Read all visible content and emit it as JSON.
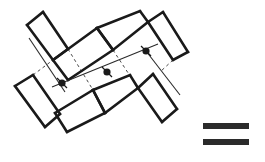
{
  "diagram": {
    "type": "line-drawing",
    "colors": {
      "stroke": "#1a1a1a",
      "bars": "#2b2b2b",
      "background": "#ffffff"
    },
    "rectangles": [
      {
        "id": "A",
        "points": "27,25 43,12 68,49 53,60"
      },
      {
        "id": "B",
        "points": "53,60 97,28 113,50 68,80"
      },
      {
        "id": "C",
        "points": "97,28 140,11 148,22 113,50"
      },
      {
        "id": "D",
        "points": "148,22 163,12 188,52 173,60"
      },
      {
        "id": "E",
        "points": "15,86 33,75 60,114 45,127"
      },
      {
        "id": "F",
        "points": "55,113 93,90 105,113 67,132"
      },
      {
        "id": "G",
        "points": "93,90 130,75 138,88 105,113"
      },
      {
        "id": "H",
        "points": "138,88 153,74 177,109 162,122"
      }
    ],
    "nodes": [
      {
        "id": "n1",
        "x": 62,
        "y": 83
      },
      {
        "id": "n2",
        "x": 107,
        "y": 72
      },
      {
        "id": "n3",
        "x": 146,
        "y": 51
      }
    ],
    "axis_line": {
      "x1": 52,
      "y1": 87,
      "x2": 158,
      "y2": 44
    },
    "thin_lines": [
      {
        "x1": 29,
        "y1": 38,
        "x2": 65,
        "y2": 92
      },
      {
        "x1": 146,
        "y1": 51,
        "x2": 180,
        "y2": 95
      }
    ],
    "dashed_lines": [
      {
        "x1": 33,
        "y1": 75,
        "x2": 53,
        "y2": 60
      },
      {
        "x1": 68,
        "y1": 49,
        "x2": 93,
        "y2": 90
      },
      {
        "x1": 113,
        "y1": 50,
        "x2": 138,
        "y2": 88
      },
      {
        "x1": 173,
        "y1": 60,
        "x2": 160,
        "y2": 72
      }
    ],
    "legend_bars": [
      {
        "x": 203,
        "y": 123,
        "width": 46,
        "height": 6
      },
      {
        "x": 203,
        "y": 139,
        "width": 46,
        "height": 6
      }
    ]
  }
}
